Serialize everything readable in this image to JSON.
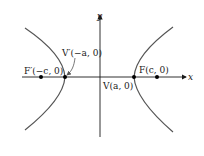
{
  "figure": {
    "type": "hyperbola",
    "axes": {
      "x_label": "x",
      "y_label": "y"
    },
    "points": {
      "left_focus": {
        "label": "F′(−c, 0)",
        "name": "F′",
        "coord": "(−c, 0)"
      },
      "left_vertex": {
        "label": "V′(−a, 0)",
        "name": "V′",
        "coord": "(−a, 0)"
      },
      "right_vertex": {
        "label": "V(a, 0)",
        "name": "V",
        "coord": "(a, 0)"
      },
      "right_focus": {
        "label": "F(c, 0)",
        "name": "F",
        "coord": "(c, 0)"
      }
    },
    "colors": {
      "axis": "#1a1a1a",
      "curve": "#555555",
      "point": "#000000",
      "text": "#1a1a1a"
    }
  }
}
